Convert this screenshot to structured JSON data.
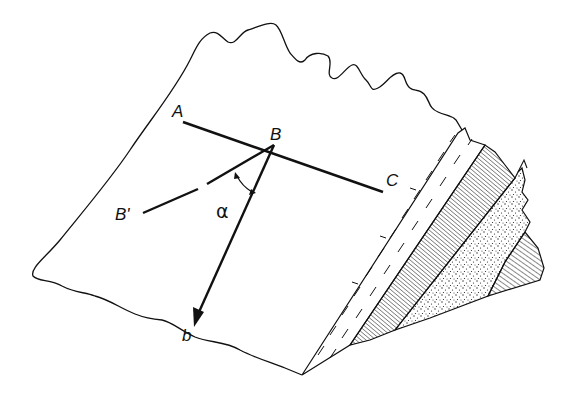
{
  "figure": {
    "type": "geological block diagram",
    "labels": {
      "A": "A",
      "B": "B",
      "C": "C",
      "B_prime": "B'",
      "b": "b",
      "alpha": "α"
    },
    "layers": [
      {
        "name": "light layer with dashed marks"
      },
      {
        "name": "finely lined layer"
      },
      {
        "name": "stippled sandstone layer"
      },
      {
        "name": "hatched layer"
      }
    ],
    "colors": {
      "ink": "#111111",
      "background": "#ffffff"
    }
  }
}
